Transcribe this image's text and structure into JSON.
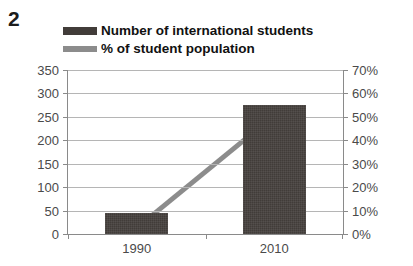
{
  "figure": {
    "number": "2"
  },
  "legend": {
    "position": "top",
    "items": [
      {
        "label": "Number of international students",
        "marker": "bar-swatch-icon",
        "color": "#413c39"
      },
      {
        "label": "% of student population",
        "marker": "line-swatch-icon",
        "color": "#8c8c8c"
      }
    ]
  },
  "chart_data": {
    "type": "bar",
    "title": "",
    "subtitle": "",
    "xlabel": "",
    "ylabel": "",
    "categories": [
      "1990",
      "2010"
    ],
    "grid": true,
    "legend_position": "top",
    "axes": {
      "left": {
        "label": "",
        "ylim": [
          0,
          350
        ],
        "ticks": [
          0,
          50,
          100,
          150,
          200,
          250,
          300,
          350
        ],
        "tick_labels": [
          "0",
          "50",
          "100",
          "150",
          "200",
          "250",
          "300",
          "350"
        ]
      },
      "right": {
        "label": "",
        "ylim": [
          0,
          70
        ],
        "ticks": [
          0,
          10,
          20,
          30,
          40,
          50,
          60,
          70
        ],
        "tick_labels": [
          "0%",
          "10%",
          "20%",
          "30%",
          "40%",
          "50%",
          "60%",
          "70%"
        ]
      }
    },
    "series": [
      {
        "name": "Number of international students",
        "type": "bar",
        "axis": "left",
        "color": "#413c39",
        "values": [
          45,
          275
        ]
      },
      {
        "name": "% of student population",
        "type": "line",
        "axis": "right",
        "color": "#8c8c8c",
        "values": [
          2,
          50
        ]
      }
    ]
  }
}
